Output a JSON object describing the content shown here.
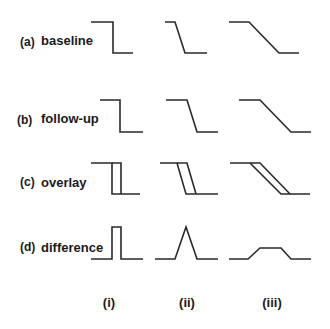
{
  "rows": [
    {
      "letter": "(a)",
      "label": "baseline"
    },
    {
      "letter": "(b)",
      "label": "follow-up"
    },
    {
      "letter": "(c)",
      "label": "overlay"
    },
    {
      "letter": "(d)",
      "label": "difference"
    }
  ],
  "columns": [
    {
      "label": "(i)"
    },
    {
      "label": "(ii)"
    },
    {
      "label": "(iii)"
    }
  ],
  "line_color": "#2a2a2a",
  "profiles": {
    "a_i": "91,22 113,22 113,53 133,53",
    "a_ii": "165,22 175,22 185,53 207,53",
    "a_iii": "229,22 249,22 279,53 299,53",
    "b_i": "100,100 120,100 120,132 143,132",
    "b_ii": "166,100 187,100 197,132 218,132",
    "b_iii": "239,100 260,100 291,132 311,132",
    "c_i_1": "91,163 112,163 112,194 140,194",
    "c_i_2": "112,163 121,163 121,194",
    "c_ii_1": "160,163 177,163 186,194 218,194",
    "c_ii_2": "177,163 187,163 196,194",
    "c_iii_1": "230,163 250,163 281,194 310,194",
    "c_iii_2": "250,163 260,163 290,194",
    "d_i": "91,259 112,259 112,227 121,227 121,259 143,259",
    "d_ii": "155,259 175,259 186,227 197,259 218,259",
    "d_iii": "229,259 248,259 260,248 281,248 291,259 311,259"
  }
}
